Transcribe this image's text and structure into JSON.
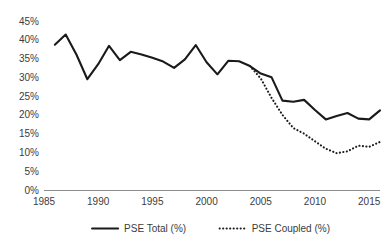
{
  "chart_data": {
    "type": "line",
    "title": "",
    "xlabel": "",
    "ylabel": "",
    "xlim": [
      1985,
      2016
    ],
    "ylim": [
      0,
      45
    ],
    "grid": false,
    "legend_position": "bottom",
    "x_tick_labels": [
      "1985",
      "1990",
      "1995",
      "2000",
      "2005",
      "2010",
      "2015"
    ],
    "x_ticks": [
      1985,
      1990,
      1995,
      2000,
      2005,
      2010,
      2015
    ],
    "y_tick_labels": [
      "0%",
      "5%",
      "10%",
      "15%",
      "20%",
      "25%",
      "30%",
      "35%",
      "40%",
      "45%"
    ],
    "y_ticks": [
      0,
      5,
      10,
      15,
      20,
      25,
      30,
      35,
      40,
      45
    ],
    "series": [
      {
        "name": "PSE Total (%)",
        "style": "solid",
        "color": "#1a1a1a",
        "x": [
          1986,
          1987,
          1988,
          1989,
          1990,
          1991,
          1992,
          1993,
          1994,
          1995,
          1996,
          1997,
          1998,
          1999,
          2000,
          2001,
          2002,
          2003,
          2004,
          2005,
          2006,
          2007,
          2008,
          2009,
          2010,
          2011,
          2012,
          2013,
          2014,
          2015,
          2016
        ],
        "values": [
          38.7,
          41.4,
          36.0,
          29.5,
          33.5,
          38.4,
          34.6,
          36.8,
          36.1,
          35.2,
          34.2,
          32.5,
          34.8,
          38.6,
          34.0,
          30.8,
          34.4,
          34.3,
          33.0,
          31.0,
          30.0,
          23.8,
          23.5,
          24.0,
          21.3,
          18.8,
          19.7,
          20.5,
          19.0,
          18.8,
          21.2
        ]
      },
      {
        "name": "PSE Coupled (%)",
        "style": "dotted",
        "color": "#1a1a1a",
        "x": [
          2004,
          2005,
          2006,
          2007,
          2008,
          2009,
          2010,
          2011,
          2012,
          2013,
          2014,
          2015,
          2016
        ],
        "values": [
          33.0,
          29.7,
          24.5,
          20.0,
          16.5,
          15.0,
          13.0,
          11.0,
          9.8,
          10.3,
          11.8,
          11.5,
          12.8
        ]
      }
    ]
  },
  "legend": {
    "items": [
      {
        "label": "PSE Total (%)",
        "style": "solid"
      },
      {
        "label": "PSE Coupled (%)",
        "style": "dotted"
      }
    ]
  }
}
